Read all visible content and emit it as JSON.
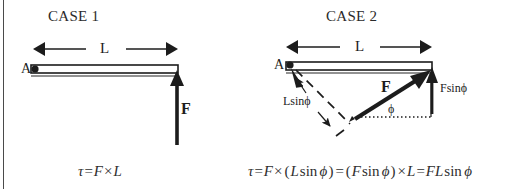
{
  "figure": {
    "width": 521,
    "height": 189,
    "background": "#ffffff",
    "ink_color": "#1c1c1c",
    "rule_color": "#4a4a4a"
  },
  "case1": {
    "title": "CASE 1",
    "pivot_label": "A",
    "length_label": "L",
    "force_label": "F",
    "equation": {
      "full": "τ = F × L",
      "tau": "τ",
      "equals": "=",
      "force": "F",
      "times": "×",
      "length": "L"
    }
  },
  "case2": {
    "title": "CASE 2",
    "pivot_label": "A",
    "length_label": "L",
    "force_label": "F",
    "angle_label": "ϕ",
    "moment_arm_label": "Lsinϕ",
    "perp_force_label": "Fsinϕ",
    "equation": {
      "full": "τ = F × (L sin ϕ) = (F sin ϕ) × L = FL sin ϕ",
      "tau": "τ",
      "equals": "=",
      "force": "F",
      "times": "×",
      "length": "L",
      "sin": "sin",
      "phi": "ϕ",
      "open_paren": "(",
      "close_paren": ")",
      "fl": "FL"
    }
  }
}
